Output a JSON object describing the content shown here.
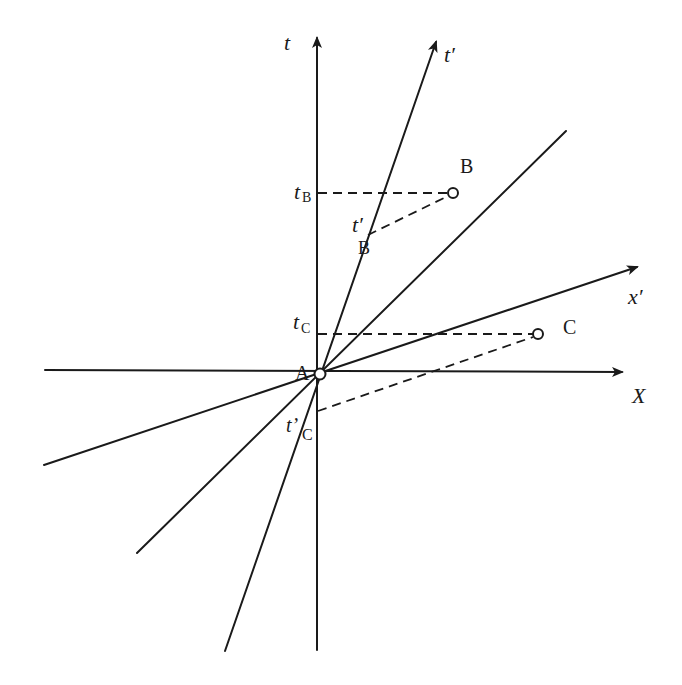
{
  "diagram": {
    "axes": {
      "t": "t",
      "x": "X",
      "t_prime": "t′",
      "x_prime": "x′"
    },
    "events": {
      "A": "A",
      "B": "B",
      "C": "C"
    },
    "projections": {
      "tB_main": "t",
      "tB_sub": "B",
      "tC_main": "t",
      "tC_sub": "C",
      "tpB_main": "t′",
      "tpB_sub": "B",
      "tpC_main": "t’",
      "tpC_sub": "C"
    }
  }
}
